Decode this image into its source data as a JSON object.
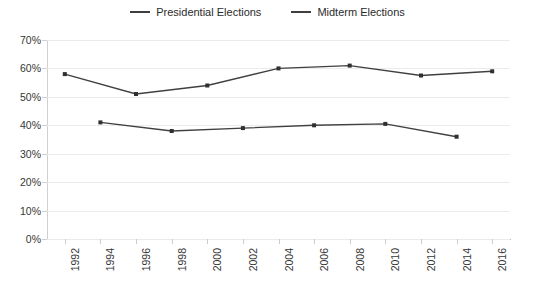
{
  "legend": {
    "position": "top-center",
    "items": [
      {
        "label": "Presidential Elections",
        "color": "#3f3f3f",
        "icon": "line-swatch-icon"
      },
      {
        "label": "Midterm Elections",
        "color": "#3f3f3f",
        "icon": "line-swatch-icon"
      }
    ]
  },
  "axes": {
    "y_ticks": [
      "0%",
      "10%",
      "20%",
      "30%",
      "40%",
      "50%",
      "60%",
      "70%"
    ],
    "x_ticks": [
      "1992",
      "1994",
      "1996",
      "1998",
      "2000",
      "2002",
      "2004",
      "2006",
      "2008",
      "2010",
      "2012",
      "2014",
      "2016"
    ]
  },
  "chart_data": {
    "type": "line",
    "title": "",
    "subtitle": "",
    "xlabel": "",
    "ylabel": "",
    "categories": [
      "1992",
      "1994",
      "1996",
      "1998",
      "2000",
      "2002",
      "2004",
      "2006",
      "2008",
      "2010",
      "2012",
      "2014",
      "2016"
    ],
    "ylim": [
      0,
      70
    ],
    "ytick_step": 10,
    "ytick_format": "percent",
    "grid": "horizontal",
    "legend_position": "top-center",
    "series": [
      {
        "name": "Presidential Elections",
        "color": "#404040",
        "marker": "square",
        "points": [
          {
            "x": "1992",
            "y": 58
          },
          {
            "x": "1996",
            "y": 51
          },
          {
            "x": "2000",
            "y": 54
          },
          {
            "x": "2004",
            "y": 60
          },
          {
            "x": "2008",
            "y": 61
          },
          {
            "x": "2012",
            "y": 57.5
          },
          {
            "x": "2016",
            "y": 59
          }
        ]
      },
      {
        "name": "Midterm Elections",
        "color": "#404040",
        "marker": "square",
        "points": [
          {
            "x": "1994",
            "y": 41
          },
          {
            "x": "1998",
            "y": 38
          },
          {
            "x": "2002",
            "y": 39
          },
          {
            "x": "2006",
            "y": 40
          },
          {
            "x": "2010",
            "y": 40.5
          },
          {
            "x": "2014",
            "y": 36
          }
        ]
      }
    ]
  }
}
